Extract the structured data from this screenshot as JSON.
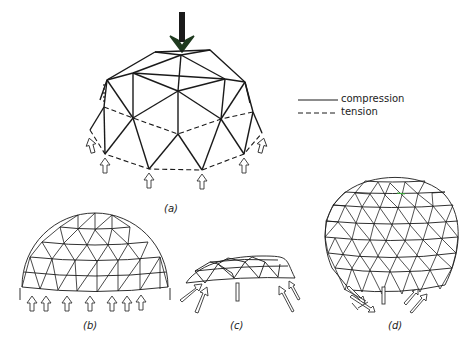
{
  "legend": {
    "items": [
      {
        "style": "solid",
        "label": "compression"
      },
      {
        "style": "dashed",
        "label": "tension"
      }
    ]
  },
  "panels": [
    {
      "id": "a",
      "label": "(a)",
      "description": "Dome with point load at apex; lower ring members in tension, support reactions upward"
    },
    {
      "id": "b",
      "label": "(b)",
      "description": "Hemispherical dome with vertical reactions around base"
    },
    {
      "id": "c",
      "label": "(c)",
      "description": "Shallow dome with inclined outward reactions"
    },
    {
      "id": "d",
      "label": "(d)",
      "description": "Near-spherical dome with inclined inward reactions"
    }
  ],
  "colors": {
    "line": "#1a1a1a",
    "load_arrow": "#1f3a1f",
    "background": "#ffffff"
  }
}
